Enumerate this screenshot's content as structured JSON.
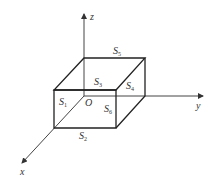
{
  "diagram": {
    "type": "3d-box-with-axes",
    "axes": {
      "x": "x",
      "y": "y",
      "z": "z",
      "origin": "O"
    },
    "faces": [
      {
        "name": "S",
        "sub": "1",
        "position": "front-left face (x-facing)"
      },
      {
        "name": "S",
        "sub": "2",
        "position": "bottom"
      },
      {
        "name": "S",
        "sub": "3",
        "position": "top face"
      },
      {
        "name": "S",
        "sub": "4",
        "position": "right face"
      },
      {
        "name": "S",
        "sub": "5",
        "position": "back top edge"
      },
      {
        "name": "S",
        "sub": "6",
        "position": "front face"
      }
    ],
    "colors": {
      "stroke": "#222222",
      "axis": "#444444",
      "text": "#333333"
    }
  }
}
